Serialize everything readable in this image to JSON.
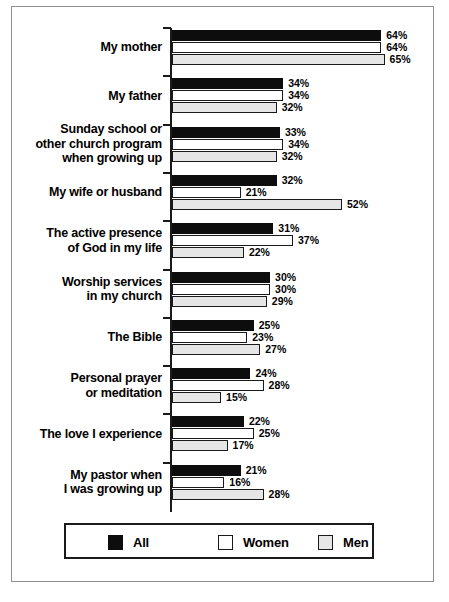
{
  "chart_data": {
    "type": "bar",
    "orientation": "horizontal",
    "title": "",
    "subtitle": "",
    "xlabel": "",
    "ylabel": "",
    "xlim": [
      0,
      70
    ],
    "grid": false,
    "value_suffix": "%",
    "legend_position": "bottom",
    "categories": [
      "My mother",
      "My father",
      "Sunday school or\nother church program\nwhen growing up",
      "My wife or husband",
      "The active presence\nof God in my life",
      "Worship services\nin my church",
      "The Bible",
      "Personal prayer\nor meditation",
      "The love I experience",
      "My pastor when\nI was growing up"
    ],
    "series": [
      {
        "name": "All",
        "color": "#0d0d0d",
        "values": [
          64,
          34,
          33,
          32,
          31,
          30,
          25,
          24,
          22,
          21
        ],
        "labels": [
          "64%",
          "34%",
          "33%",
          "32%",
          "31%",
          "30%",
          "25%",
          "24%",
          "22%",
          "21%"
        ]
      },
      {
        "name": "Women",
        "color": "#ffffff",
        "values": [
          64,
          34,
          34,
          21,
          37,
          30,
          23,
          28,
          25,
          16
        ],
        "labels": [
          "64%",
          "34%",
          "34%",
          "21%",
          "37%",
          "30%",
          "23%",
          "28%",
          "25%",
          "16%"
        ]
      },
      {
        "name": "Men",
        "color": "#e6e6e6",
        "values": [
          65,
          32,
          32,
          52,
          22,
          29,
          27,
          15,
          17,
          28
        ],
        "labels": [
          "65%",
          "32%",
          "32%",
          "52%",
          "22%",
          "29%",
          "27%",
          "15%",
          "17%",
          "28%"
        ]
      }
    ]
  },
  "legend": {
    "items": [
      {
        "label": "All",
        "swatch": "black-swatch"
      },
      {
        "label": "Women",
        "swatch": "white-swatch"
      },
      {
        "label": "Men",
        "swatch": "lightgray-swatch"
      }
    ]
  },
  "footer": {
    "mark": ""
  }
}
